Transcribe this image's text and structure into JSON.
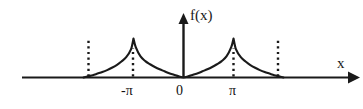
{
  "figure": {
    "width": 363,
    "height": 109,
    "background": "#ffffff",
    "stroke_color": "#1a1a1a",
    "text_color": "#111111"
  },
  "axes": {
    "y_axis_label": "f(x)",
    "x_axis_label": "x",
    "origin_label": "0"
  },
  "ticks": [
    {
      "name": "neg-pi",
      "label": "-π",
      "x_value": -3.14159
    },
    {
      "name": "zero",
      "label": "0",
      "x_value": 0
    },
    {
      "name": "pi",
      "label": "π",
      "x_value": 3.14159
    }
  ],
  "chart_data": {
    "type": "line",
    "title": "",
    "xlabel": "x",
    "ylabel": "f(x)",
    "xlim": [
      -6.6,
      6.6
    ],
    "ylim": [
      0,
      1.15
    ],
    "grid": false,
    "legend": null,
    "x_tick_labels": [
      "-π",
      "0",
      "π"
    ],
    "x_tick_values": [
      -3.14159,
      0,
      3.14159
    ],
    "y_tick_labels": [],
    "annotations": [
      {
        "text": "f(x)",
        "x": 0,
        "y": 1.15,
        "role": "y-axis-label"
      },
      {
        "text": "x",
        "x": 6.4,
        "y": 0.12,
        "role": "x-axis-label"
      },
      {
        "text": "0",
        "x": 0.15,
        "y": -0.12,
        "role": "origin-label"
      },
      {
        "text": "-π",
        "x": -3.14159,
        "y": -0.12,
        "role": "tick-label"
      },
      {
        "text": "π",
        "x": 3.14159,
        "y": -0.12,
        "role": "tick-label"
      }
    ],
    "dotted_guides": [
      {
        "x": -6.28318,
        "y_top": 1.0,
        "label": "-2π"
      },
      {
        "x": -3.14159,
        "y_top": 0.72,
        "label": "-π"
      },
      {
        "x": 3.14159,
        "y_top": 0.72,
        "label": "π"
      },
      {
        "x": 6.28318,
        "y_top": 1.0,
        "label": "2π"
      }
    ],
    "series": [
      {
        "name": "f(x)",
        "x": [
          -6.283,
          -6.0,
          -5.7,
          -5.4,
          -5.1,
          -4.8,
          -4.5,
          -4.2,
          -3.9,
          -3.6,
          -3.3,
          -3.142,
          -3.0,
          -2.7,
          -2.4,
          -2.1,
          -1.8,
          -1.5,
          -1.2,
          -0.9,
          -0.6,
          -0.3,
          0.0,
          0.3,
          0.6,
          0.9,
          1.2,
          1.5,
          1.8,
          2.1,
          2.4,
          2.7,
          3.0,
          3.142,
          3.3,
          3.6,
          3.9,
          4.2,
          4.5,
          4.8,
          5.1,
          5.4,
          5.7,
          6.0,
          6.283
        ],
        "y": [
          0.0,
          0.03,
          0.06,
          0.1,
          0.14,
          0.19,
          0.25,
          0.32,
          0.41,
          0.52,
          0.72,
          1.0,
          0.78,
          0.54,
          0.42,
          0.34,
          0.27,
          0.21,
          0.16,
          0.11,
          0.07,
          0.03,
          0.0,
          0.03,
          0.07,
          0.11,
          0.16,
          0.21,
          0.27,
          0.34,
          0.42,
          0.54,
          0.78,
          1.0,
          0.72,
          0.52,
          0.41,
          0.32,
          0.25,
          0.19,
          0.14,
          0.1,
          0.06,
          0.03,
          0.0
        ]
      }
    ]
  }
}
